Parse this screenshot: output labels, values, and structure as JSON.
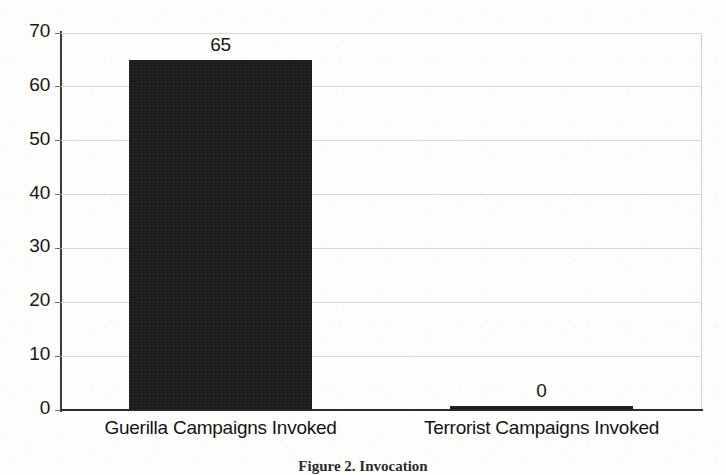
{
  "chart_data": {
    "type": "bar",
    "title": "",
    "subtitle": "",
    "xlabel": "",
    "ylabel": "",
    "categories": [
      "Guerilla Campaigns Invoked",
      "Terrorist Campaigns Invoked"
    ],
    "values": [
      65,
      0
    ],
    "data_labels": [
      "65",
      "0"
    ],
    "ylim": [
      0,
      70
    ],
    "yticks": [
      0,
      10,
      20,
      30,
      40,
      50,
      60,
      70
    ],
    "ytick_labels": [
      "0",
      "10",
      "20",
      "30",
      "40",
      "50",
      "60",
      "70"
    ],
    "grid": true,
    "grid_axis": "y",
    "legend": false,
    "legend_position": "none",
    "bar_color": "#1b1b1b",
    "grid_color": "#d8d8d8",
    "axis_color": "#2b2b2b",
    "background_color": "#fdfdfb",
    "text_color": "#161616"
  },
  "caption": {
    "text": "Figure 2. Invocation"
  }
}
